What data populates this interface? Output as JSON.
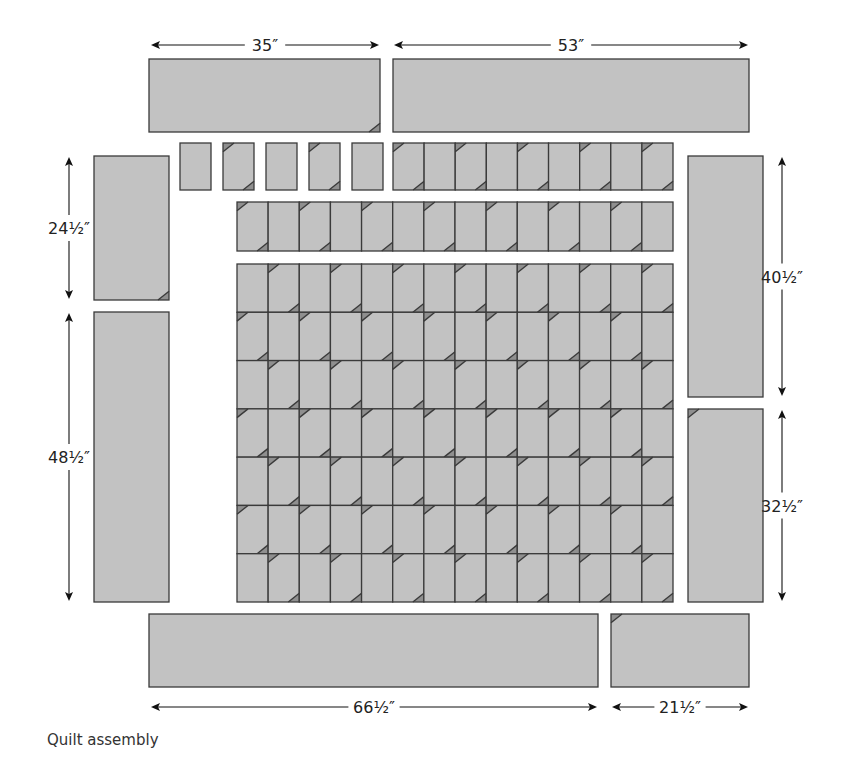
{
  "caption": "Quilt assembly",
  "colors": {
    "fabric": "#c2c2c2",
    "corner_triangle": "#8f8f8f",
    "outline": "#3a3a3a",
    "arrow": "#111111",
    "label": "#222222"
  },
  "dimensions": {
    "top_left": "35″",
    "top_right": "53″",
    "left_top": "24½″",
    "left_bottom": "48½″",
    "right_top": "40½″",
    "right_bottom": "32½″",
    "bottom_left": "66½″",
    "bottom_right": "21½″"
  },
  "borders": [
    {
      "id": "top-left-border",
      "x": 149,
      "y": 59,
      "w": 231,
      "h": 73,
      "corner": "br"
    },
    {
      "id": "top-right-border",
      "x": 393,
      "y": 59,
      "w": 356,
      "h": 73,
      "corner": null
    },
    {
      "id": "left-top-border",
      "x": 94,
      "y": 156,
      "w": 75,
      "h": 144,
      "corner": "br"
    },
    {
      "id": "left-bottom-border",
      "x": 94,
      "y": 312,
      "w": 75,
      "h": 290,
      "corner": null
    },
    {
      "id": "right-top-border",
      "x": 688,
      "y": 156,
      "w": 75,
      "h": 241,
      "corner": null
    },
    {
      "id": "right-bottom-border",
      "x": 688,
      "y": 409,
      "w": 75,
      "h": 193,
      "corner": "tl"
    },
    {
      "id": "bottom-left-border",
      "x": 149,
      "y": 614,
      "w": 449,
      "h": 73,
      "corner": null
    },
    {
      "id": "bottom-right-border",
      "x": 611,
      "y": 614,
      "w": 138,
      "h": 73,
      "corner": "tl"
    }
  ],
  "arrows": [
    {
      "id": "dim-top-left",
      "orient": "h",
      "x1": 151,
      "x2": 379,
      "y": 45,
      "label_key": "top_left"
    },
    {
      "id": "dim-top-right",
      "orient": "h",
      "x1": 394,
      "x2": 748,
      "y": 45,
      "label_key": "top_right"
    },
    {
      "id": "dim-left-top",
      "orient": "v",
      "x": 69,
      "y1": 157,
      "y2": 299,
      "label_key": "left_top"
    },
    {
      "id": "dim-left-bottom",
      "orient": "v",
      "x": 69,
      "y1": 313,
      "y2": 601,
      "label_key": "left_bottom"
    },
    {
      "id": "dim-right-top",
      "orient": "v",
      "x": 782,
      "y1": 157,
      "y2": 396,
      "label_key": "right_top"
    },
    {
      "id": "dim-right-bottom",
      "orient": "v",
      "x": 782,
      "y1": 410,
      "y2": 601,
      "label_key": "right_bottom"
    },
    {
      "id": "dim-bottom-left",
      "orient": "h",
      "x1": 151,
      "x2": 597,
      "y": 707,
      "label_key": "bottom_left"
    },
    {
      "id": "dim-bottom-right",
      "orient": "h",
      "x1": 612,
      "x2": 748,
      "y": 707,
      "label_key": "bottom_right"
    }
  ],
  "row1_separate": {
    "y": 143,
    "h": 47,
    "w": 31,
    "xs": [
      180,
      223,
      266,
      309,
      352
    ],
    "pattern": [
      "plain",
      "diag",
      "plain",
      "diag",
      "plain"
    ]
  },
  "row1_joined": {
    "x": 393,
    "y": 143,
    "h": 47,
    "cols": 9,
    "x_end": 673,
    "pattern": [
      "diag",
      "plain",
      "diag",
      "plain",
      "diag",
      "plain",
      "diag",
      "plain",
      "diag"
    ]
  },
  "row2": {
    "x": 237,
    "y": 202,
    "h": 49,
    "cols": 14,
    "x_end": 673,
    "first": "diag"
  },
  "main_grid": {
    "x": 237,
    "y": 264,
    "x_end": 673,
    "y_end": 602,
    "cols": 14,
    "rows": 7,
    "row_first": [
      "plain",
      "diag",
      "plain",
      "diag",
      "plain",
      "diag",
      "plain"
    ]
  }
}
